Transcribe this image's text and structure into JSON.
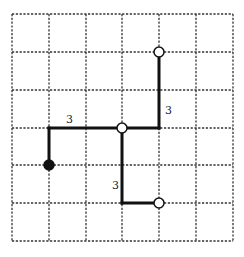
{
  "diagram": {
    "grid": {
      "columns": 6,
      "rows": 6,
      "x_lines": [
        12,
        49,
        86,
        122,
        159,
        196,
        233
      ],
      "y_lines": [
        14,
        52,
        90,
        128,
        165,
        203,
        241
      ],
      "line_color": "#333333",
      "style": "dashed"
    },
    "path_color": "#111111",
    "segments": [
      {
        "from": [
          1,
          4
        ],
        "to": [
          1,
          3
        ]
      },
      {
        "from": [
          1,
          3
        ],
        "to": [
          3,
          3
        ]
      },
      {
        "from": [
          3,
          3
        ],
        "to": [
          4,
          3
        ]
      },
      {
        "from": [
          4,
          3
        ],
        "to": [
          4,
          1
        ]
      },
      {
        "from": [
          3,
          3
        ],
        "to": [
          3,
          5
        ]
      },
      {
        "from": [
          3,
          5
        ],
        "to": [
          4,
          5
        ]
      }
    ],
    "nodes": [
      {
        "name": "start-node",
        "at": [
          1,
          4
        ],
        "type": "filled"
      },
      {
        "name": "junction-node",
        "at": [
          3,
          3
        ],
        "type": "open"
      },
      {
        "name": "top-end-node",
        "at": [
          4,
          1
        ],
        "type": "open"
      },
      {
        "name": "bottom-end-node",
        "at": [
          4,
          5
        ],
        "type": "open"
      }
    ],
    "labels": [
      {
        "text": "3",
        "x": 66,
        "y": 123,
        "name": "label-horizontal-segment"
      },
      {
        "text": "3",
        "x": 165,
        "y": 114,
        "name": "label-upper-vertical-segment"
      },
      {
        "text": "3",
        "x": 112,
        "y": 189,
        "name": "label-lower-vertical-segment"
      }
    ]
  }
}
